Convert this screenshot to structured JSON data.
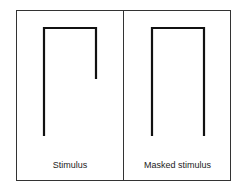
{
  "panels": [
    {
      "label": "Stimulus",
      "shape": "open-bracket-with-short-right-leg"
    },
    {
      "label": "Masked stimulus",
      "shape": "inverted-u-bracket"
    }
  ],
  "colors": {
    "line": "#111111",
    "frame": "#333333",
    "background": "#ffffff"
  }
}
